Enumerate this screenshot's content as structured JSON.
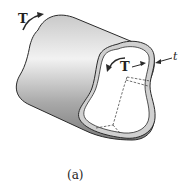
{
  "diagram": {
    "labels": {
      "torque_outer": "T",
      "torque_inner": "T",
      "thickness": "t",
      "caption": "(a)"
    },
    "colors": {
      "line": "#2a2a2a",
      "surface_light": "#e6e6e6",
      "surface_dark": "#8c8c8c",
      "wall_edge": "#bdbdbd"
    }
  }
}
